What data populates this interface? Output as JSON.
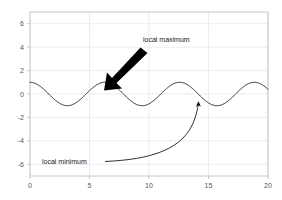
{
  "chart_data": {
    "type": "line",
    "title": "",
    "xlabel": "",
    "ylabel": "",
    "xlim": [
      0,
      20
    ],
    "ylim": [
      -7,
      7
    ],
    "grid": true,
    "legend": null,
    "function": "y = cos(x)",
    "series": [
      {
        "name": "cos(x)",
        "color": "#2b2b2b",
        "x": [
          0,
          0.5,
          1,
          1.5,
          2,
          2.5,
          3,
          3.5,
          4,
          4.5,
          5,
          5.5,
          6,
          6.5,
          7,
          7.5,
          8,
          8.5,
          9,
          9.5,
          10,
          10.5,
          11,
          11.5,
          12,
          12.5,
          13,
          13.5,
          14,
          14.5,
          15,
          15.5,
          16,
          16.5,
          17,
          17.5,
          18,
          18.5,
          19,
          19.5,
          20
        ],
        "values": [
          1.0,
          0.878,
          0.54,
          0.071,
          -0.416,
          -0.801,
          -0.99,
          -0.936,
          -0.654,
          -0.211,
          0.284,
          0.709,
          0.96,
          0.977,
          0.754,
          0.347,
          -0.146,
          -0.602,
          -0.911,
          -0.997,
          -0.839,
          -0.483,
          -0.004,
          0.484,
          0.844,
          0.999,
          0.907,
          0.596,
          0.137,
          -0.361,
          -0.76,
          -0.979,
          -0.958,
          -0.699,
          -0.275,
          0.221,
          0.661,
          0.94,
          0.988,
          0.794,
          0.408
        ]
      }
    ],
    "xticks": [
      0,
      5,
      10,
      15,
      20
    ],
    "xtick_labels": [
      "0",
      "5",
      "10",
      "15",
      "20"
    ],
    "yticks": [
      -6,
      -4,
      -2,
      0,
      2,
      4,
      6
    ],
    "ytick_labels": [
      "-6",
      "-4",
      "-2",
      "0",
      "2",
      "4",
      "6"
    ],
    "annotations": [
      {
        "id": "local-maximum",
        "text": "local maximum",
        "text_x": 11.2,
        "text_y": 3.85,
        "point_x": 6.28,
        "point_y": 1.0,
        "arrow_style": "thick-straight",
        "color": "#000000"
      },
      {
        "id": "local-minimum",
        "text": "local minimum",
        "text_x": 1.3,
        "text_y": -5.95,
        "point_x": 15.71,
        "point_y": -1.0,
        "arrow_style": "thin-curved",
        "color": "#1a1a1a"
      }
    ]
  },
  "figure": {
    "background": "#ffffff",
    "grid_color": "#e4e4ea",
    "spine_color": "#b9b9c2",
    "tick_label_color": "#555555"
  }
}
